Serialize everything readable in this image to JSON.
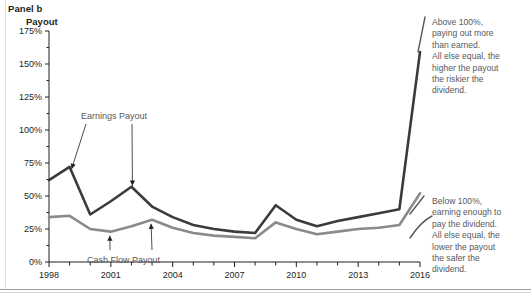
{
  "panel": {
    "label": "Panel b",
    "axis_title": "Payout"
  },
  "notes": {
    "top": [
      "Above 100%,",
      "paying out more",
      "than earned.",
      "All else equal, the",
      "higher the payout",
      "the riskier the",
      "dividend."
    ],
    "bottom": [
      "Below 100%,",
      "earning enough to",
      "pay the dividend.",
      "All else equal, the",
      "lower the payout",
      "the safer the",
      "dividend."
    ]
  },
  "colors": {
    "earnings_line": "#3b3b3b",
    "cashflow_line": "#8a8a8a",
    "axis": "#231f20",
    "note_text": "#58595b",
    "background": "#ffffff"
  },
  "chart_data": {
    "type": "line",
    "title": "Panel b",
    "xlabel": "",
    "ylabel": "Payout",
    "xlim": [
      1998,
      2016
    ],
    "ylim": [
      0,
      175
    ],
    "ytick_labels": [
      "0%",
      "25%",
      "50%",
      "75%",
      "100%",
      "125%",
      "150%",
      "175%"
    ],
    "ytick_values": [
      0,
      25,
      50,
      75,
      100,
      125,
      150,
      175
    ],
    "ytick_minor_step": 12.5,
    "xtick_labels": [
      "1998",
      "2001",
      "2004",
      "2007",
      "2010",
      "2013",
      "2016"
    ],
    "xtick_values": [
      1998,
      2001,
      2004,
      2007,
      2010,
      2013,
      2016
    ],
    "xtick_minor_step": 1,
    "grid": false,
    "legend": "inline-annotations",
    "x": [
      1998,
      1999,
      2000,
      2001,
      2002,
      2003,
      2004,
      2005,
      2006,
      2007,
      2008,
      2009,
      2010,
      2011,
      2012,
      2013,
      2014,
      2015,
      2016
    ],
    "series": [
      {
        "name": "Earnings Payout",
        "color": "#3b3b3b",
        "values": [
          62,
          72,
          36,
          46,
          57,
          42,
          34,
          28,
          25,
          23,
          22,
          43,
          32,
          27,
          31,
          34,
          37,
          40,
          159
        ]
      },
      {
        "name": "Cash Flow Payout",
        "color": "#8a8a8a",
        "values": [
          34,
          35,
          25,
          23,
          27,
          32,
          26,
          22,
          20,
          19,
          18,
          30,
          25,
          21,
          23,
          25,
          26,
          28,
          52
        ]
      }
    ],
    "annotations": [
      {
        "text": "Earnings Payout",
        "points_to": [
          [
            1999,
            72
          ],
          [
            2002,
            57
          ]
        ]
      },
      {
        "text": "Cash Flow Payout",
        "points_to": [
          [
            2001,
            23
          ],
          [
            2003,
            32
          ]
        ]
      },
      {
        "text": "Above 100%, paying out more than earned. All else equal, the higher the payout the riskier the dividend."
      },
      {
        "text": "Below 100%, earning enough to pay the dividend. All else equal, the lower the payout the safer the dividend."
      }
    ]
  }
}
